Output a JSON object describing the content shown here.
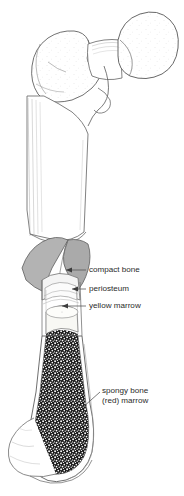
{
  "figure": {
    "background_color": "#ffffff",
    "outline_color": "#4a4a4a",
    "text_color": "#2b2b2b",
    "periosteum_fill": "#b0b0b0",
    "compact_bone_fill": "#f2f2f2",
    "yellow_marrow_fill": "#f7f7f5",
    "spongy_bone_fill": "#1a1a1a"
  },
  "labels": {
    "compact_bone": "compact bone",
    "periosteum": "periosteum",
    "yellow_marrow": "yellow marrow",
    "spongy_bone_line1": "spongy bone",
    "spongy_bone_line2": "(red) marrow"
  },
  "regions": {
    "femoral_head": "femoral head",
    "greater_trochanter": "greater trochanter",
    "neck": "femoral neck",
    "shaft": "diaphysis shaft",
    "distal_end": "distal end"
  }
}
